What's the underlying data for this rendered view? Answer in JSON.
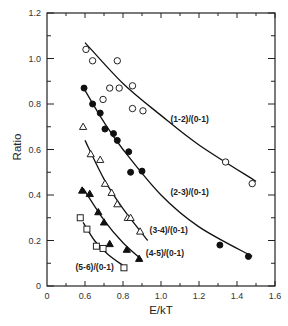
{
  "chart_data": {
    "type": "scatter",
    "title": "",
    "xlabel": "E/kT",
    "ylabel": "Ratio",
    "xlim": [
      0,
      1.6
    ],
    "ylim": [
      0,
      1.2
    ],
    "x_axis_break": [
      0,
      0.5
    ],
    "xticks": [
      {
        "value": 0,
        "label": "0"
      },
      {
        "value": 0.6,
        "label": "0.6"
      },
      {
        "value": 0.8,
        "label": "0.8"
      },
      {
        "value": 1.0,
        "label": "1.0"
      },
      {
        "value": 1.2,
        "label": "1.2"
      },
      {
        "value": 1.4,
        "label": "1.4"
      },
      {
        "value": 1.6,
        "label": "1.6"
      }
    ],
    "yticks": [
      {
        "value": 0,
        "label": "0"
      },
      {
        "value": 0.2,
        "label": "0.2"
      },
      {
        "value": 0.4,
        "label": "0.4"
      },
      {
        "value": 0.6,
        "label": "0.6"
      },
      {
        "value": 0.8,
        "label": "0.8"
      },
      {
        "value": 1.0,
        "label": "1.0"
      },
      {
        "value": 1.2,
        "label": "1.2"
      }
    ],
    "grid": false,
    "legend": "none (inline labels)",
    "series": [
      {
        "name": "(1-2)/(0-1)",
        "marker": "open-circle",
        "x": [
          0.605,
          0.64,
          0.77,
          0.695,
          0.73,
          0.78,
          0.85,
          0.85,
          0.905,
          1.34,
          1.48
        ],
        "y": [
          1.04,
          0.99,
          0.99,
          0.82,
          0.87,
          0.87,
          0.88,
          0.78,
          0.77,
          0.545,
          0.45
        ],
        "fit": {
          "x": [
            0.6,
            0.8,
            1.0,
            1.2,
            1.5
          ],
          "y": [
            1.07,
            0.89,
            0.75,
            0.62,
            0.46
          ]
        },
        "label_at": {
          "x": 1.05,
          "y": 0.72
        }
      },
      {
        "name": "(2-3)/(0-1)",
        "marker": "filled-circle",
        "x": [
          0.595,
          0.64,
          0.68,
          0.705,
          0.75,
          0.77,
          0.83,
          0.84,
          0.9,
          1.31,
          1.46
        ],
        "y": [
          0.87,
          0.8,
          0.76,
          0.69,
          0.67,
          0.64,
          0.59,
          0.5,
          0.505,
          0.18,
          0.13
        ],
        "fit": {
          "x": [
            0.6,
            0.7,
            0.8,
            1.0,
            1.2,
            1.48
          ],
          "y": [
            0.86,
            0.72,
            0.6,
            0.4,
            0.26,
            0.13
          ]
        },
        "label_at": {
          "x": 1.05,
          "y": 0.4
        }
      },
      {
        "name": "(3-4)/(0-1)",
        "marker": "open-triangle",
        "x": [
          0.59,
          0.63,
          0.68,
          0.705,
          0.74,
          0.77,
          0.825,
          0.84,
          0.89
        ],
        "y": [
          0.7,
          0.58,
          0.555,
          0.45,
          0.41,
          0.36,
          0.3,
          0.3,
          0.24
        ],
        "fit": {
          "x": [
            0.6,
            0.7,
            0.8,
            0.93
          ],
          "y": [
            0.64,
            0.47,
            0.34,
            0.2
          ]
        },
        "label_at": {
          "x": 0.94,
          "y": 0.235
        }
      },
      {
        "name": "(4-5)/(0-1)",
        "marker": "filled-triangle",
        "x": [
          0.585,
          0.625,
          0.67,
          0.7,
          0.73,
          0.82,
          0.885
        ],
        "y": [
          0.42,
          0.405,
          0.325,
          0.28,
          0.185,
          0.16,
          0.12
        ],
        "fit": {
          "x": [
            0.59,
            0.7,
            0.8,
            0.9
          ],
          "y": [
            0.43,
            0.29,
            0.19,
            0.115
          ]
        },
        "label_at": {
          "x": 0.92,
          "y": 0.13
        }
      },
      {
        "name": "(5-6)/(0-1)",
        "marker": "open-square",
        "x": [
          0.575,
          0.61,
          0.66,
          0.695,
          0.805
        ],
        "y": [
          0.3,
          0.25,
          0.175,
          0.165,
          0.08
        ],
        "fit": {
          "x": [
            0.59,
            0.65,
            0.72,
            0.8
          ],
          "y": [
            0.28,
            0.2,
            0.14,
            0.09
          ]
        },
        "label_at": {
          "x": 0.55,
          "y": 0.07
        }
      }
    ]
  }
}
